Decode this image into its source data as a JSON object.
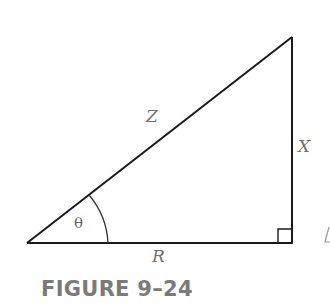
{
  "figure": {
    "caption": "FIGURE 9–24",
    "type": "right-triangle",
    "labels": {
      "hypotenuse": "Z",
      "opposite": "X",
      "adjacent": "R",
      "angle": "θ"
    },
    "vertices": {
      "left": [
        27,
        243
      ],
      "right_angle": [
        292,
        243
      ],
      "top": [
        292,
        37
      ]
    },
    "right_angle_marker": true,
    "colors": {
      "lines": "#1a1a1a",
      "labels": "#6e6e6e",
      "caption": "#7a7a7a",
      "background": "#ffffff"
    }
  }
}
